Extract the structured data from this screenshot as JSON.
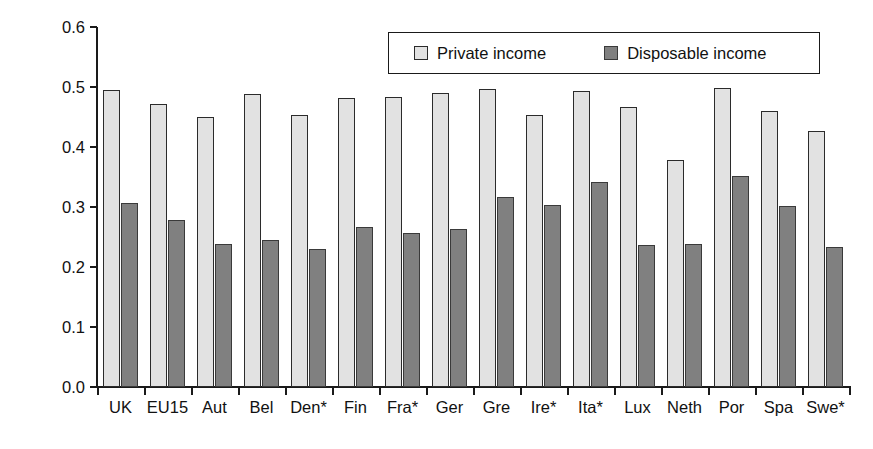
{
  "chart_data": {
    "type": "bar",
    "title": "",
    "xlabel": "",
    "ylabel": "Gini coefficient",
    "ylim": [
      0.0,
      0.6
    ],
    "ytick_labels": [
      "0.0",
      "0.1",
      "0.2",
      "0.3",
      "0.4",
      "0.5",
      "0.6"
    ],
    "ytick_values": [
      0.0,
      0.1,
      0.2,
      0.3,
      0.4,
      0.5,
      0.6
    ],
    "grid": false,
    "legend_position": "top-right",
    "categories": [
      "UK",
      "EU15",
      "Aut",
      "Bel",
      "Den*",
      "Fin",
      "Fra*",
      "Ger",
      "Gre",
      "Ire*",
      "Ita*",
      "Lux",
      "Neth",
      "Por",
      "Spa",
      "Swe*"
    ],
    "series": [
      {
        "name": "Private income",
        "color": "#e2e2e2",
        "values": [
          0.495,
          0.472,
          0.45,
          0.489,
          0.454,
          0.481,
          0.484,
          0.49,
          0.497,
          0.454,
          0.493,
          0.466,
          0.378,
          0.498,
          0.46,
          0.427
        ]
      },
      {
        "name": "Disposable income",
        "color": "#808080",
        "values": [
          0.307,
          0.278,
          0.238,
          0.245,
          0.23,
          0.266,
          0.256,
          0.263,
          0.317,
          0.303,
          0.342,
          0.236,
          0.239,
          0.352,
          0.301,
          0.233
        ]
      }
    ]
  }
}
